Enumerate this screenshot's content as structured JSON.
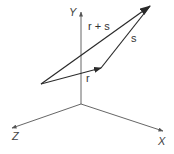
{
  "diagram": {
    "type": "vector-addition-3d",
    "axes": {
      "origin": [
        81,
        104
      ],
      "y": {
        "label": "Y",
        "end": [
          81,
          12
        ],
        "label_pos": [
          69,
          16
        ]
      },
      "z": {
        "label": "Z",
        "end": [
          12,
          128
        ],
        "label_pos": [
          12,
          140
        ]
      },
      "x": {
        "label": "X",
        "end": [
          163,
          131
        ],
        "label_pos": [
          158,
          145
        ]
      }
    },
    "vectors": [
      {
        "name": "r",
        "label": "r",
        "from": [
          41,
          84
        ],
        "to": [
          101,
          68
        ],
        "label_pos": [
          86,
          82
        ]
      },
      {
        "name": "s",
        "label": "s",
        "from": [
          101,
          68
        ],
        "to": [
          150,
          6
        ],
        "label_pos": [
          131,
          42
        ]
      },
      {
        "name": "r_plus_s",
        "label": "r + s",
        "from": [
          41,
          84
        ],
        "to": [
          150,
          6
        ],
        "label_pos": [
          88,
          30
        ]
      }
    ],
    "colors": {
      "axis": "#555555",
      "vector": "#2a2a2a",
      "text": "#333333",
      "background": "#ffffff"
    }
  }
}
